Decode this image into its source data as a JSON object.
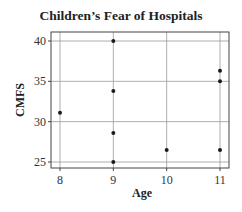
{
  "chart_data": {
    "type": "scatter",
    "title": "Children’s Fear of Hospitals",
    "xlabel": "Age",
    "ylabel": "CMFS",
    "xlim": [
      7.85,
      11.15
    ],
    "ylim": [
      24.2,
      41.1
    ],
    "xticks": [
      8,
      9,
      10,
      11
    ],
    "yticks": [
      25,
      30,
      35,
      40
    ],
    "grid": true,
    "legend": null,
    "points": [
      {
        "x": 8,
        "y": 31.1
      },
      {
        "x": 9,
        "y": 40.0
      },
      {
        "x": 9,
        "y": 33.8
      },
      {
        "x": 9,
        "y": 28.6
      },
      {
        "x": 9,
        "y": 25.0
      },
      {
        "x": 10,
        "y": 26.5
      },
      {
        "x": 11,
        "y": 36.3
      },
      {
        "x": 11,
        "y": 35.0
      },
      {
        "x": 11,
        "y": 26.5
      }
    ],
    "colors": {
      "point": "#1a1a1a",
      "grid": "#9a9a9a",
      "frame": "#444444"
    }
  }
}
